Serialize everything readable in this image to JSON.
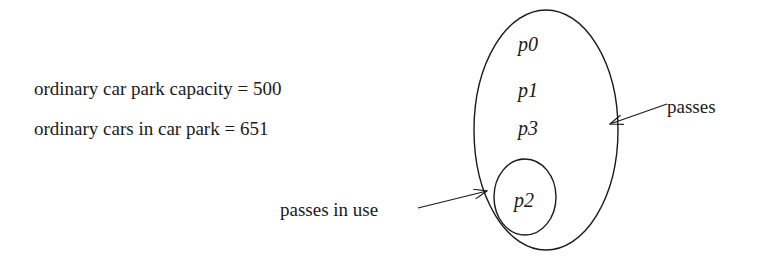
{
  "labels": {
    "capacity": "ordinary car park capacity = 500",
    "cars": "ordinary cars in car park = 651",
    "passes": "passes",
    "passes_in_use": "passes in use"
  },
  "sets": {
    "passes": {
      "name": "passes",
      "elements": [
        "p0",
        "p1",
        "p3"
      ]
    },
    "passes_in_use": {
      "name": "passes in use",
      "elements": [
        "p2"
      ]
    }
  },
  "values": {
    "capacity": 500,
    "cars_in_park": 651
  },
  "colors": {
    "stroke": "#1a1a1a",
    "background": "#ffffff"
  }
}
